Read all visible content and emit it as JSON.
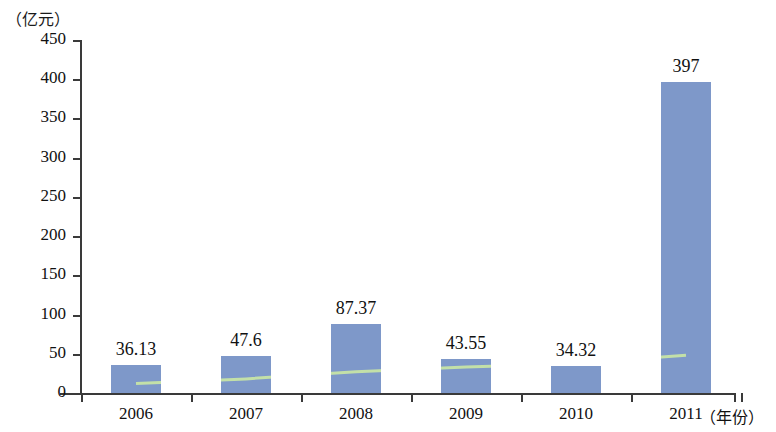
{
  "chart_data": {
    "type": "bar",
    "title": "",
    "subtitle": "",
    "xlabel": "（年份）",
    "ylabel": "（亿元）",
    "categories": [
      "2006",
      "2007",
      "2008",
      "2009",
      "2010",
      "2011"
    ],
    "values": [
      36.13,
      47.6,
      87.37,
      43.55,
      34.32,
      397
    ],
    "value_labels": [
      "36.13",
      "47.6",
      "87.37",
      "43.55",
      "34.32",
      "397"
    ],
    "ylim": [
      0,
      450
    ],
    "ytick_step": 50,
    "yticks": [
      0,
      50,
      100,
      150,
      200,
      250,
      300,
      350,
      400,
      450
    ],
    "ytick_labels": [
      "0",
      "50",
      "100",
      "150",
      "200",
      "250",
      "300",
      "350",
      "400",
      "450"
    ],
    "grid": false,
    "legend": null,
    "legend_position": "none",
    "bar_color": "#7e98c9",
    "axis_color": "#3a3a3a",
    "series": [
      {
        "name": "bars",
        "type": "bar",
        "values": [
          36.13,
          47.6,
          87.37,
          43.55,
          34.32,
          397
        ],
        "color": "#7e98c9"
      },
      {
        "name": "overlay-line",
        "type": "line",
        "values": [
          12,
          18,
          27,
          33,
          38,
          48
        ],
        "color": "#c3e0a8",
        "note": "pale green line drawn across the bars; not visible over white gaps"
      }
    ]
  }
}
